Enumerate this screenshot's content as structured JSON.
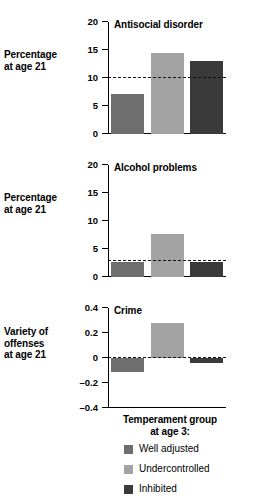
{
  "chart_data": {
    "type": "bar",
    "title": "",
    "xlabel": "Temperament group at age 3:",
    "categories": [
      "Well adjusted",
      "Undercontrolled",
      "Inhibited"
    ],
    "legend_position": "bottom",
    "grid": false,
    "colors": {
      "well_adjusted": "#6e6e6e",
      "undercontrolled": "#a3a3a3",
      "inhibited": "#3a3a3a",
      "axis": "#000000",
      "refline": "#111111"
    },
    "panels": [
      {
        "title": "Antisocial disorder",
        "ylabel": "Percentage at age 21",
        "ylabel_line1": "Percentage",
        "ylabel_line2": "at age 21",
        "ylim": [
          0,
          20
        ],
        "yticks": [
          0,
          5,
          10,
          15,
          20
        ],
        "ytick_labels": [
          "0",
          "5",
          "10",
          "15",
          "20"
        ],
        "reference_line": 10,
        "values": [
          7.2,
          14.5,
          13.0
        ]
      },
      {
        "title": "Alcohol problems",
        "ylabel": "Percentage at age 21",
        "ylabel_line1": "Percentage",
        "ylabel_line2": "at age 21",
        "ylim": [
          0,
          20
        ],
        "yticks": [
          0,
          5,
          10,
          15,
          20
        ],
        "ytick_labels": [
          "0",
          "5",
          "10",
          "15",
          "20"
        ],
        "reference_line": 3,
        "values": [
          2.6,
          7.7,
          2.6
        ]
      },
      {
        "title": "Crime",
        "ylabel": "Variety of offenses at age 21",
        "ylabel_line1": "Variety of",
        "ylabel_line2": "offenses",
        "ylabel_line3": "at age 21",
        "ylim": [
          -0.4,
          0.4
        ],
        "yticks": [
          -0.4,
          -0.2,
          0,
          0.2,
          0.4
        ],
        "ytick_labels": [
          "–0.4",
          "–0.2",
          "0",
          "0.2",
          "0.4"
        ],
        "reference_line": 0,
        "values": [
          -0.11,
          0.28,
          -0.04
        ]
      }
    ]
  },
  "xcaption": {
    "line1": "Temperament group",
    "line2": "at age 3:"
  },
  "legend": {
    "items": [
      {
        "label": "Well adjusted",
        "color": "#6e6e6e"
      },
      {
        "label": "Undercontrolled",
        "color": "#a3a3a3"
      },
      {
        "label": "Inhibited",
        "color": "#3a3a3a"
      }
    ]
  }
}
